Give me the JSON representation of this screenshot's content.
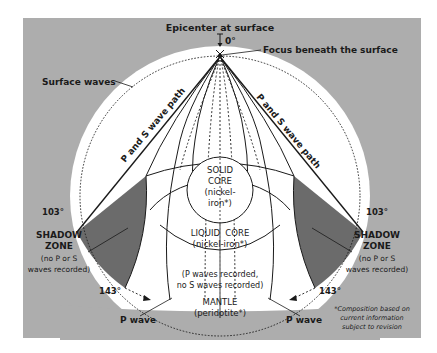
{
  "colors": {
    "panel": "#adadad",
    "earth": "#ffffff",
    "shadow_zone": "#6b6b6b",
    "line": "#1a1a1a"
  },
  "labels": {
    "epicenter": "Epicenter at surface",
    "zero_degree": "0°",
    "focus": "Focus beneath the surface",
    "surface_waves": "Surface waves",
    "ps_path_left": "P and S wave path",
    "ps_path_right": "P and S wave path",
    "solid_core": [
      "SOLID",
      "CORE",
      "(nickel-",
      "iron*)"
    ],
    "liquid_core": [
      "LIQUID  CORE",
      "(nickel-iron*)"
    ],
    "mantle_note": [
      "(P waves recorded,",
      "no S waves recorded)"
    ],
    "mantle": [
      "MANTLE",
      "(peridotite*)"
    ],
    "shadow_left": {
      "degree_top": "103°",
      "title": [
        "SHADOW",
        "ZONE"
      ],
      "note": [
        "(no P or S",
        "waves recorded)"
      ],
      "degree_bottom": "143°"
    },
    "shadow_right": {
      "degree_top": "103°",
      "title": [
        "SHADOW",
        "ZONE"
      ],
      "note": [
        "(no P or S",
        "waves recorded)"
      ],
      "degree_bottom": "143°"
    },
    "p_wave_left": "P wave",
    "p_wave_right": "P wave",
    "footnote": [
      "*Composition based on",
      "current information",
      "subject to revision"
    ]
  }
}
